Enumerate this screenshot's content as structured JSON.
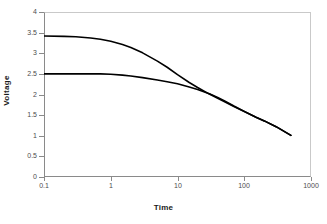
{
  "chart_data": {
    "type": "line",
    "title": "",
    "xlabel": "Time",
    "ylabel": "Voltage",
    "xscale": "log",
    "yscale": "linear",
    "xlim": [
      0.1,
      1000
    ],
    "ylim": [
      0,
      4
    ],
    "grid": false,
    "legend": null,
    "xticks": [
      "0.1",
      "1",
      "10",
      "100",
      "1000"
    ],
    "xtick_values": [
      0.1,
      1,
      10,
      100,
      1000
    ],
    "yticks": [
      "0",
      "0.5",
      "1",
      "1.5",
      "2",
      "2.5",
      "3",
      "3.5",
      "4"
    ],
    "ytick_values": [
      0,
      0.5,
      1,
      1.5,
      2,
      2.5,
      3,
      3.5,
      4
    ],
    "line_color": "#000000",
    "series": [
      {
        "name": "upper-curve",
        "x": [
          0.1,
          0.2,
          0.3,
          0.5,
          0.7,
          1,
          1.5,
          2,
          3,
          5,
          7,
          10,
          15,
          20,
          30,
          40,
          50,
          70,
          100,
          150,
          200,
          300,
          500
        ],
        "y": [
          3.42,
          3.41,
          3.4,
          3.37,
          3.34,
          3.29,
          3.21,
          3.14,
          3.01,
          2.81,
          2.66,
          2.48,
          2.29,
          2.17,
          2.01,
          1.91,
          1.83,
          1.71,
          1.59,
          1.45,
          1.36,
          1.22,
          1.01
        ]
      },
      {
        "name": "lower-curve",
        "x": [
          0.1,
          0.2,
          0.3,
          0.5,
          0.7,
          1,
          1.5,
          2,
          3,
          5,
          7,
          10,
          15,
          20,
          30,
          40,
          50,
          70,
          100,
          150,
          200,
          300,
          500
        ],
        "y": [
          2.5,
          2.5,
          2.5,
          2.5,
          2.5,
          2.49,
          2.47,
          2.45,
          2.41,
          2.35,
          2.31,
          2.26,
          2.18,
          2.12,
          2.02,
          1.93,
          1.85,
          1.72,
          1.59,
          1.45,
          1.36,
          1.22,
          1.01
        ]
      }
    ]
  }
}
